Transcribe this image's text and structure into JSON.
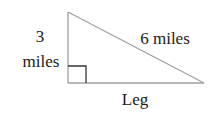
{
  "diagram": {
    "type": "right-triangle",
    "labels": {
      "vertical_leg_line1": "3",
      "vertical_leg_line2": "miles",
      "hypotenuse": "6 miles",
      "horizontal_leg": "Leg"
    },
    "colors": {
      "triangle_stroke": "#a0a0a0",
      "right_angle_marker": "#333333",
      "text": "#1a1a1a"
    }
  }
}
